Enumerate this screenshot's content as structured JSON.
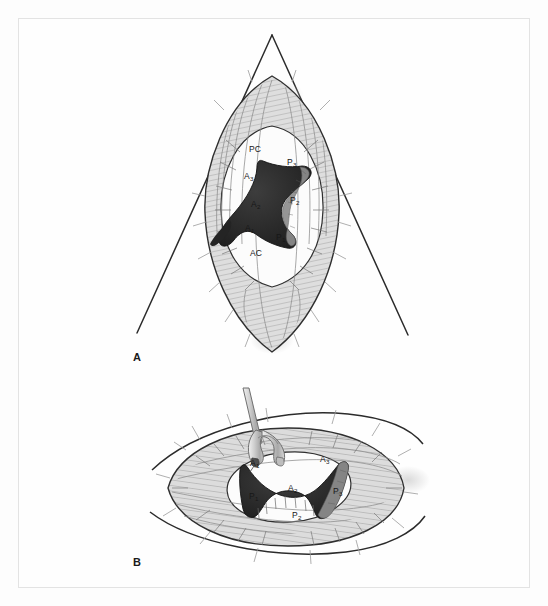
{
  "figure": {
    "background_color": "#fdfdfd",
    "frame_color": "#e3e3e3",
    "ink_color": "#1a1a1a",
    "tissue_fill": "#d9d9d9",
    "tissue_shade": "#b4b4b4",
    "orifice_fill": "#2b2b2b",
    "orifice_highlight": "#6e6e6e",
    "instrument_fill": "#c9c9c9"
  },
  "panels": [
    {
      "id": "A",
      "letter": "A",
      "caption_letter": "A",
      "view": "vertical-oriented mitral valve seen through triangular atriotomy retraction",
      "labels": [
        {
          "key": "PC",
          "text": "PC",
          "subscript": "",
          "x": 249,
          "y": 145,
          "meaning": "posterior commissure"
        },
        {
          "key": "P3",
          "text": "P",
          "subscript": "3",
          "x": 287,
          "y": 158,
          "meaning": "posterior leaflet segment 3"
        },
        {
          "key": "A3",
          "text": "A",
          "subscript": "3",
          "x": 244,
          "y": 172,
          "meaning": "anterior leaflet segment 3"
        },
        {
          "key": "A2",
          "text": "A",
          "subscript": "2",
          "x": 251,
          "y": 200,
          "meaning": "anterior leaflet segment 2"
        },
        {
          "key": "P2",
          "text": "P",
          "subscript": "2",
          "x": 290,
          "y": 196,
          "meaning": "posterior leaflet segment 2"
        },
        {
          "key": "A1",
          "text": "A",
          "subscript": "1",
          "x": 245,
          "y": 224,
          "meaning": "anterior leaflet segment 1"
        },
        {
          "key": "P1",
          "text": "P",
          "subscript": "1",
          "x": 276,
          "y": 233,
          "meaning": "posterior leaflet segment 1"
        },
        {
          "key": "AC",
          "text": "AC",
          "subscript": "",
          "x": 250,
          "y": 249,
          "meaning": "anterior commissure"
        }
      ]
    },
    {
      "id": "B",
      "letter": "B",
      "caption_letter": "B",
      "view": "horizontally oriented mitral valve with retractor hook placed on anterior leaflet",
      "labels": [
        {
          "key": "A1",
          "text": "A",
          "subscript": "1",
          "x": 250,
          "y": 459,
          "meaning": "anterior leaflet segment 1"
        },
        {
          "key": "A3",
          "text": "A",
          "subscript": "3",
          "x": 320,
          "y": 455,
          "meaning": "anterior leaflet segment 3"
        },
        {
          "key": "A2",
          "text": "A",
          "subscript": "2",
          "x": 288,
          "y": 484,
          "meaning": "anterior leaflet segment 2"
        },
        {
          "key": "P3",
          "text": "P",
          "subscript": "3",
          "x": 333,
          "y": 487,
          "meaning": "posterior leaflet segment 3"
        },
        {
          "key": "P1",
          "text": "P",
          "subscript": "1",
          "x": 249,
          "y": 492,
          "meaning": "posterior leaflet segment 1"
        },
        {
          "key": "P2",
          "text": "P",
          "subscript": "2",
          "x": 292,
          "y": 511,
          "meaning": "posterior leaflet segment 2"
        }
      ],
      "instrument": {
        "name": "valve-retractor-hook",
        "type": "forked surgical hook"
      }
    }
  ],
  "geometry": {
    "panel_a_triangle": {
      "apex_x": 272,
      "apex_y": 35,
      "left_x": 137,
      "left_y": 333,
      "right_x": 408,
      "right_y": 335
    }
  }
}
